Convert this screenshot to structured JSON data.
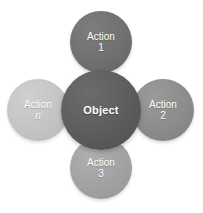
{
  "diagram": {
    "type": "radial-hub-and-spoke",
    "background_color": "#ffffff",
    "width": 203,
    "height": 213,
    "connector_color": "#c9c9c9",
    "center_node": {
      "label": "Object",
      "color": "#5a5a5a",
      "color_light": "#6c6c6c",
      "text_color": "#ffffff",
      "diameter": 80,
      "x": 61,
      "y": 70
    },
    "satellite_nodes": [
      {
        "id": "action-1",
        "line1": "Action",
        "line2": "1",
        "position": "top",
        "color": "#6e6e6e",
        "color_light": "#7e7e7e",
        "text_color": "#ffffff",
        "diameter": 62,
        "x": 70,
        "y": 11
      },
      {
        "id": "action-2",
        "line1": "Action",
        "line2": "2",
        "position": "right",
        "color": "#8a8a8a",
        "color_light": "#9a9a9a",
        "text_color": "#ffffff",
        "diameter": 62,
        "x": 132,
        "y": 79
      },
      {
        "id": "action-3",
        "line1": "Action",
        "line2": "3",
        "position": "bottom",
        "color": "#a0a0a0",
        "color_light": "#afafaf",
        "text_color": "#ffffff",
        "diameter": 62,
        "x": 70,
        "y": 137
      },
      {
        "id": "action-n",
        "line1": "Action",
        "line2": "n",
        "line2_italic": true,
        "position": "left",
        "color": "#c2c2c2",
        "color_light": "#d0d0d0",
        "text_color": "#ffffff",
        "diameter": 62,
        "x": 7,
        "y": 79
      }
    ]
  }
}
